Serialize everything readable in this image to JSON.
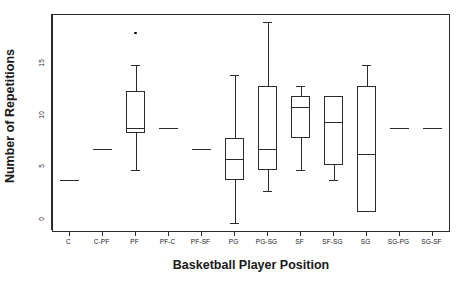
{
  "chart_data": {
    "type": "box",
    "title": "",
    "xlabel": "Basketball Player Position",
    "ylabel": "Number of Repetitions",
    "ylim": [
      -0.8,
      19.7
    ],
    "yticks": [
      0,
      5,
      10,
      15
    ],
    "ytick_labels": [
      "0",
      "5",
      "10",
      "15"
    ],
    "grid": false,
    "legend": null,
    "categories": [
      "C",
      "C-PF",
      "PF",
      "PF-C",
      "PF-SF",
      "PG",
      "PG-SG",
      "SF",
      "SF-SG",
      "SG",
      "SG-PG",
      "SG-SF"
    ],
    "boxes": [
      {
        "category": "C",
        "min": 4,
        "q1": 4,
        "median": 4,
        "q3": 4,
        "max": 4,
        "outliers": [],
        "degenerate": true
      },
      {
        "category": "C-PF",
        "min": 7,
        "q1": 7,
        "median": 7,
        "q3": 7,
        "max": 7,
        "outliers": [],
        "degenerate": true
      },
      {
        "category": "PF",
        "min": 5,
        "q1": 8.5,
        "median": 9,
        "q3": 12.5,
        "max": 15,
        "outliers": [
          18
        ],
        "degenerate": false
      },
      {
        "category": "PF-C",
        "min": 9,
        "q1": 9,
        "median": 9,
        "q3": 9,
        "max": 9,
        "outliers": [],
        "degenerate": true
      },
      {
        "category": "PF-SF",
        "min": 7,
        "q1": 7,
        "median": 7,
        "q3": 7,
        "max": 7,
        "outliers": [],
        "degenerate": true
      },
      {
        "category": "PG",
        "min": 0,
        "q1": 4,
        "median": 6,
        "q3": 8,
        "max": 14,
        "outliers": [],
        "degenerate": false
      },
      {
        "category": "PG-SG",
        "min": 3,
        "q1": 5,
        "median": 7,
        "q3": 13,
        "max": 19,
        "outliers": [],
        "degenerate": false
      },
      {
        "category": "SF",
        "min": 5,
        "q1": 8,
        "median": 11,
        "q3": 12,
        "max": 13,
        "outliers": [],
        "degenerate": false
      },
      {
        "category": "SF-SG",
        "min": 4,
        "q1": 5.5,
        "median": 9.5,
        "q3": 12,
        "max": 12,
        "outliers": [],
        "degenerate": false
      },
      {
        "category": "SG",
        "min": 1,
        "q1": 1,
        "median": 6.5,
        "q3": 13,
        "max": 15,
        "outliers": [],
        "degenerate": false
      },
      {
        "category": "SG-PG",
        "min": 9,
        "q1": 9,
        "median": 9,
        "q3": 9,
        "max": 9,
        "outliers": [],
        "degenerate": true
      },
      {
        "category": "SG-SF",
        "min": 9,
        "q1": 9,
        "median": 9,
        "q3": 9,
        "max": 9,
        "outliers": [],
        "degenerate": true
      }
    ],
    "style": {
      "line_color": "#2b2b2b",
      "point_color": "#000000",
      "background": "#ffffff"
    }
  },
  "axes": {
    "y_title": "Number of Repetitions",
    "x_title": "Basketball Player Position"
  }
}
